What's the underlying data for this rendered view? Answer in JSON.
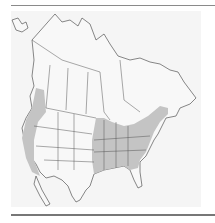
{
  "map": {
    "type": "range-map",
    "region": "North America",
    "colors": {
      "background": "#f5f5f5",
      "land": "#f7f7f7",
      "range": "#c4c4c4",
      "borders": "#555555",
      "rules": "#8a8a8a"
    },
    "ranges": [
      {
        "name": "west-coast-range",
        "description": "Pacific coast from southern British Columbia through Washington, Oregon, California"
      },
      {
        "name": "eastern-range",
        "description": "Eastern United States from Great Plains edge to Atlantic, north into southern Ontario/Quebec and Maritimes"
      }
    ]
  }
}
